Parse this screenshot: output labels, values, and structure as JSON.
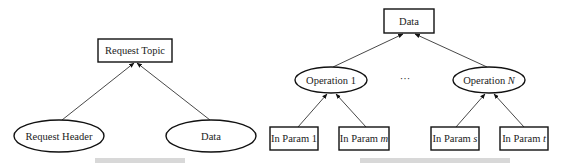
{
  "left_diagram": {
    "root": {
      "label": "Request Topic"
    },
    "children": [
      {
        "label": "Request Header"
      },
      {
        "label": "Data"
      }
    ]
  },
  "right_diagram": {
    "root": {
      "label": "Data"
    },
    "operations": [
      {
        "label_prefix": "Operation ",
        "label_var": "1",
        "params": [
          {
            "label_prefix": "In Param ",
            "label_var": "1"
          },
          {
            "label_prefix": "In Param ",
            "label_var": "m"
          }
        ]
      },
      {
        "label_prefix": "Operation ",
        "label_var": "N",
        "params": [
          {
            "label_prefix": "In Param ",
            "label_var": "s"
          },
          {
            "label_prefix": "In Param ",
            "label_var": "t"
          }
        ]
      }
    ],
    "ellipsis": "···"
  },
  "colors": {
    "stroke": "#111111",
    "background": "#ffffff",
    "caption": "#d8d8d8"
  }
}
